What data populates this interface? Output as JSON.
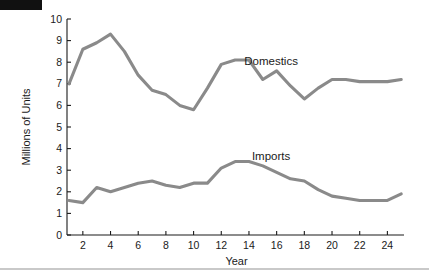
{
  "chart_data": {
    "type": "line",
    "title": "",
    "xlabel": "Year",
    "ylabel": "Millions of Units",
    "xlim": [
      1,
      25.2
    ],
    "ylim": [
      0,
      10
    ],
    "grid": false,
    "legend_position": "inline-annotation",
    "x": [
      1,
      2,
      3,
      4,
      5,
      6,
      7,
      8,
      9,
      10,
      11,
      12,
      13,
      14,
      15,
      16,
      17,
      18,
      19,
      20,
      21,
      22,
      23,
      24,
      25
    ],
    "xticks": [
      2,
      4,
      6,
      8,
      10,
      12,
      14,
      16,
      18,
      20,
      22,
      24
    ],
    "xticklabels": [
      "2",
      "4",
      "6",
      "8",
      "10",
      "12",
      "14",
      "16",
      "18",
      "20",
      "22",
      "24"
    ],
    "yticks": [
      0,
      1,
      2,
      3,
      4,
      5,
      6,
      7,
      8,
      9,
      10
    ],
    "yticklabels": [
      "0",
      "1",
      "2",
      "3",
      "4",
      "5",
      "6",
      "7",
      "8",
      "9",
      "10"
    ],
    "series": [
      {
        "name": "Domestics",
        "color": "#8a8a8a",
        "label_x": 15.6,
        "label_y": 7.85,
        "values": [
          7.0,
          8.6,
          8.9,
          9.3,
          8.5,
          7.4,
          6.7,
          6.5,
          6.0,
          5.8,
          6.8,
          7.9,
          8.1,
          8.1,
          7.2,
          7.6,
          6.9,
          6.3,
          6.8,
          7.2,
          7.2,
          7.1,
          7.1,
          7.1,
          7.2
        ]
      },
      {
        "name": "Imports",
        "color": "#8a8a8a",
        "label_x": 15.6,
        "label_y": 3.45,
        "values": [
          1.6,
          1.5,
          2.2,
          2.0,
          2.2,
          2.4,
          2.5,
          2.3,
          2.2,
          2.4,
          2.4,
          3.1,
          3.4,
          3.4,
          3.2,
          2.9,
          2.6,
          2.5,
          2.1,
          1.8,
          1.7,
          1.6,
          1.6,
          1.6,
          1.9
        ]
      }
    ]
  },
  "decor": {
    "black_bar": "black-marker-bar",
    "bottom_rule": "bottom-divider-rule"
  }
}
